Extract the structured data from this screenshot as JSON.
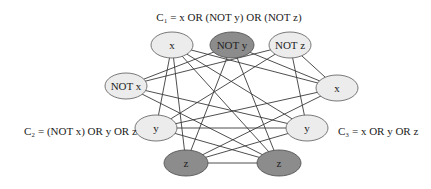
{
  "diagram": {
    "type": "3-SAT to clique reduction graph",
    "clauses": [
      {
        "id": "C1",
        "label": "C₁ = x OR (NOT y) OR (NOT z)",
        "x": 229,
        "y": 17,
        "anchor": "middle"
      },
      {
        "id": "C2",
        "label": "C₂ = (NOT x) OR y OR z",
        "x": 24,
        "y": 131,
        "anchor": "start"
      },
      {
        "id": "C3",
        "label": "C₃ = x OR y OR z",
        "x": 338,
        "y": 131,
        "anchor": "start"
      }
    ],
    "nodes": [
      {
        "id": "c1x",
        "clause": "C1",
        "label": "x",
        "cx": 172,
        "cy": 45,
        "rx": 21,
        "ry": 13,
        "shade": "light"
      },
      {
        "id": "c1ny",
        "clause": "C1",
        "label": "NOT y",
        "cx": 232,
        "cy": 45,
        "rx": 22,
        "ry": 13,
        "shade": "dark"
      },
      {
        "id": "c1nz",
        "clause": "C1",
        "label": "NOT z",
        "cx": 290,
        "cy": 45,
        "rx": 21,
        "ry": 13,
        "shade": "light"
      },
      {
        "id": "c2nx",
        "clause": "C2",
        "label": "NOT x",
        "cx": 126,
        "cy": 86,
        "rx": 21,
        "ry": 13,
        "shade": "light"
      },
      {
        "id": "c2y",
        "clause": "C2",
        "label": "y",
        "cx": 156,
        "cy": 128,
        "rx": 21,
        "ry": 13,
        "shade": "light"
      },
      {
        "id": "c2z",
        "clause": "C2",
        "label": "z",
        "cx": 186,
        "cy": 163,
        "rx": 22,
        "ry": 13,
        "shade": "dark"
      },
      {
        "id": "c3x",
        "clause": "C3",
        "label": "x",
        "cx": 337,
        "cy": 88,
        "rx": 21,
        "ry": 13,
        "shade": "light"
      },
      {
        "id": "c3y",
        "clause": "C3",
        "label": "y",
        "cx": 307,
        "cy": 128,
        "rx": 21,
        "ry": 13,
        "shade": "light"
      },
      {
        "id": "c3z",
        "clause": "C3",
        "label": "z",
        "cx": 279,
        "cy": 163,
        "rx": 22,
        "ry": 13,
        "shade": "dark"
      }
    ],
    "edges": [
      [
        "c1x",
        "c2y"
      ],
      [
        "c1x",
        "c2z"
      ],
      [
        "c1x",
        "c3x"
      ],
      [
        "c1x",
        "c3y"
      ],
      [
        "c1x",
        "c3z"
      ],
      [
        "c1ny",
        "c2nx"
      ],
      [
        "c1ny",
        "c2z"
      ],
      [
        "c1ny",
        "c3x"
      ],
      [
        "c1ny",
        "c3z"
      ],
      [
        "c1nz",
        "c2nx"
      ],
      [
        "c1nz",
        "c2y"
      ],
      [
        "c1nz",
        "c3x"
      ],
      [
        "c1nz",
        "c3y"
      ],
      [
        "c2nx",
        "c3y"
      ],
      [
        "c2nx",
        "c3z"
      ],
      [
        "c2y",
        "c3x"
      ],
      [
        "c2y",
        "c3y"
      ],
      [
        "c2y",
        "c3z"
      ],
      [
        "c2z",
        "c3x"
      ],
      [
        "c2z",
        "c3y"
      ],
      [
        "c2z",
        "c3z"
      ]
    ],
    "colors": {
      "light_fill": "#ececec",
      "dark_fill": "#8c8c8c",
      "stroke": "#3a3a3a"
    }
  }
}
